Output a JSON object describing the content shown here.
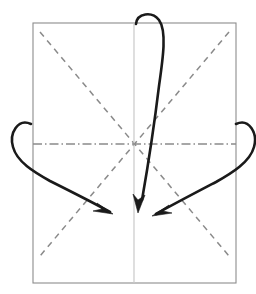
{
  "diagram": {
    "background_color": "#ffffff"
  },
  "paper": {
    "name": "paper-sheet",
    "shape": "rectangle",
    "fill_color": "#ffffff",
    "stroke_color": "#8c8c8c",
    "x": 33,
    "y": 23,
    "width": 203,
    "height": 260
  },
  "center_point": {
    "label": "center-intersection",
    "x": 134,
    "y": 144
  },
  "creases": [
    {
      "name": "crease-diagonal-top-left-to-bottom-right",
      "style": "valley-dashed",
      "color": "#8a8a8a",
      "x1": 40,
      "y1": 32,
      "x2": 229,
      "y2": 256
    },
    {
      "name": "crease-diagonal-top-right-to-bottom-left",
      "style": "valley-dashed",
      "color": "#8a8a8a",
      "x1": 229,
      "y1": 32,
      "x2": 40,
      "y2": 256
    },
    {
      "name": "crease-horizontal-mountain",
      "style": "mountain-dash-dot",
      "color": "#8a8a8a",
      "x1": 33,
      "y1": 144,
      "x2": 236,
      "y2": 144
    },
    {
      "name": "crease-vertical-center",
      "style": "solid-light",
      "color": "#c9c9c9",
      "x1": 134,
      "y1": 23,
      "x2": 134,
      "y2": 283
    }
  ],
  "arrows": [
    {
      "name": "fold-arrow-left",
      "direction": "down-right",
      "start_x": 31,
      "start_y": 124,
      "tip_x": 113,
      "tip_y": 214,
      "color": "#1a1a1a",
      "path": "M 31 124 C 18 118, 9 133, 13 147 C 17 162, 34 172, 50 181 C 72 192, 94 203, 110 212",
      "head": "M 113 214 L 97 203 L 102 209 L 93 211 Z"
    },
    {
      "name": "fold-arrow-center",
      "direction": "down",
      "start_x": 136,
      "start_y": 24,
      "tip_x": 138,
      "tip_y": 213,
      "color": "#1a1a1a",
      "path": "M 136 24 C 137 13, 152 11, 159 20 C 167 31, 163 58, 159 86 C 155 119, 149 160, 142 200",
      "head": "M 138 213 L 133 194 L 138 200 L 145 195 Z"
    },
    {
      "name": "fold-arrow-right",
      "direction": "down-left",
      "start_x": 236,
      "start_y": 124,
      "tip_x": 152,
      "tip_y": 216,
      "color": "#1a1a1a",
      "path": "M 236 124 C 249 118, 258 133, 254 147 C 250 162, 232 173, 216 182 C 195 193, 172 205, 156 214",
      "head": "M 152 216 L 169 205 L 163 211 L 172 213 Z"
    }
  ]
}
